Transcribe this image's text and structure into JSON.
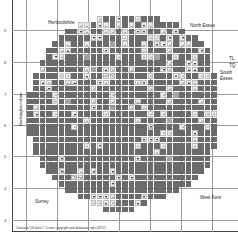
{
  "map": {
    "labels": {
      "hertfordshire": "Hertfordshire",
      "north_essex": "North Essex",
      "south_essex": "South\nEssex",
      "south_essex_line1": "South",
      "south_essex_line2": "Essex",
      "buckinghamshire": "Buckinghamshire",
      "surrey": "Surrey",
      "west_kent": "West Kent",
      "tl": "TL",
      "tq": "TQ"
    },
    "axis_ticks_left": [
      "9",
      "8",
      "7",
      "6",
      "5",
      "4",
      "3"
    ],
    "copyright": "Contains OS data © Crown copyright and database right (2017)",
    "legend_codes": {
      "D": "dark grey square",
      "M": "mid grey square",
      "L": "light grey square",
      "U": "grey up triangle",
      "A": "black up triangle",
      "V": "black down triangle"
    },
    "colors": {
      "dark": "#6b6b6b",
      "mid": "#a3a3a3",
      "light": "#cfcfcf",
      "symbol_bg": "#ececec",
      "triangle_black": "#111111",
      "triangle_grey": "#9a9a9a"
    },
    "grid": {
      "cols": 30,
      "rows": 31,
      "cell_px": 6.35,
      "rows_data": [
        "...........UDDVDDUDDD.........",
        "........UUDVUDUDUDVUDDDD......",
        "......DDVUDDUUDUDVVDDUDVD.....",
        ".....DDDDDVVDDDUDDDUUDVDVDD...",
        "....DDUDDUDDDMDUDDUDVVUDUUDD..",
        "...DDUADDDDDVDDDDDUDDDUDDDDVD.",
        "...DVUDDDMDDDDUDDDUUMDDUDDUDD.",
        "..DDDDDDDDDDDDDDDDDDDDUDDVVDD.",
        "..UDDDDDDUMDAUDDUDDDDVUDDAADD.",
        ".DDDDLUDDVDDUUDDDDDUDDDAUDDUUD",
        ".DAUDDUADDDVUDDDDUVDDDDDUAUDDD",
        ".DDVDDDDDDUDDDDDDDDUDDUDDDUDDD",
        "DDDDUDDDDDDDDUDDDDDDDUDMDDDDDD",
        "DDDDLDMDDDUDDUDDDUDDDDUDDDDUDD",
        "DUDDDDDDDDVDDMDDUDUDDDDDDDDDDD",
        "DVDDUDDVDDDDUDDDDDDUDUDDDDUDUU",
        "DDDDDDDDDUDDDDDDDUDDDDMDDDDUDD",
        "DDDDDDDUDDDDDDDDDDDVDDDDUDDDUD",
        "DDDDDDDDDDDDDDDDDDDDDUUDDDVDDD",
        ".DDDDDDDDDDDDDDDDDVVVDDDDDUDDD",
        ".DDDDDDDDUDVDDDDDUDDDUDDDDUDDD",
        ".DDDDDDDDDDDDDDDDDDDUDDDDDDDD.",
        "..DDDVDDDDDDDDDDDVDDDDMDDDDDD.",
        "..DDDDDDDDDDDDDDDDDDDDDDDDDDD.",
        "...DDVDDUDVDDVDDDDDDDDDDDDDD..",
        "....DDDUUDDDDDVDVDDDDDDDDDD...",
        ".....DDDDDDDDVDDDDDDDDDDDD....",
        "......DDDDDDDDDDDDDDDDDD......",
        "........DDVVVUDDDDVDDD........",
        "..........UUVUDDDVD...........",
        "............DDDDD............."
      ]
    }
  }
}
